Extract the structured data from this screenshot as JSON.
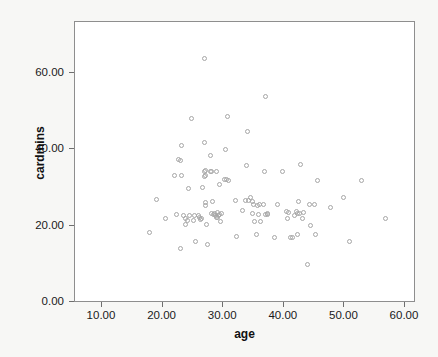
{
  "chart_data": {
    "type": "scatter",
    "title": "",
    "xlabel": "age",
    "ylabel": "cardmins",
    "xlim": [
      7.5,
      63.5
    ],
    "ylim": [
      0,
      73.5
    ],
    "grid": false,
    "legend": null,
    "xticks": [
      "10.00",
      "20.00",
      "30.00",
      "40.00",
      "50.00",
      "60.00"
    ],
    "xtick_values": [
      10,
      20,
      30,
      40,
      50,
      60
    ],
    "yticks": [
      "0.00",
      "20.00",
      "40.00",
      "60.00"
    ],
    "ytick_values": [
      0,
      20,
      40,
      60
    ],
    "marker": "open-circle",
    "marker_color": "#a6a6a6",
    "background_color": "#f7f7f5",
    "plot_background_color": "#ffffff",
    "frame_color": "#8e8e8e",
    "n_points": 108,
    "points": [
      [
        18.0,
        18.0
      ],
      [
        19.2,
        26.6
      ],
      [
        20.6,
        21.7
      ],
      [
        22.2,
        33.0
      ],
      [
        22.4,
        22.6
      ],
      [
        22.8,
        37.0
      ],
      [
        23.2,
        36.9
      ],
      [
        23.3,
        40.8
      ],
      [
        23.3,
        33.0
      ],
      [
        23.2,
        13.8
      ],
      [
        23.9,
        21.6
      ],
      [
        24.0,
        20.0
      ],
      [
        24.5,
        29.6
      ],
      [
        24.6,
        22.4
      ],
      [
        25.0,
        47.7
      ],
      [
        25.2,
        21.0
      ],
      [
        25.4,
        22.4
      ],
      [
        25.6,
        15.7
      ],
      [
        26.1,
        22.4
      ],
      [
        26.4,
        21.4
      ],
      [
        26.6,
        21.5
      ],
      [
        26.8,
        29.7
      ],
      [
        27.0,
        41.6
      ],
      [
        27.1,
        34.0
      ],
      [
        27.1,
        32.6
      ],
      [
        27.0,
        63.6
      ],
      [
        27.2,
        25.8
      ],
      [
        27.3,
        25.0
      ],
      [
        27.4,
        20.0
      ],
      [
        27.6,
        14.7
      ],
      [
        28.0,
        33.8
      ],
      [
        28.1,
        38.0
      ],
      [
        28.3,
        33.9
      ],
      [
        28.4,
        26.0
      ],
      [
        28.6,
        22.6
      ],
      [
        28.8,
        22.8
      ],
      [
        29.0,
        21.8
      ],
      [
        29.1,
        33.8
      ],
      [
        29.2,
        23.2
      ],
      [
        29.4,
        22.3
      ],
      [
        29.5,
        30.6
      ],
      [
        29.6,
        22.6
      ],
      [
        29.8,
        20.7
      ],
      [
        30.3,
        31.8
      ],
      [
        30.6,
        39.8
      ],
      [
        30.7,
        31.8
      ],
      [
        30.8,
        48.4
      ],
      [
        32.2,
        26.4
      ],
      [
        32.4,
        16.8
      ],
      [
        33.4,
        23.7
      ],
      [
        33.8,
        26.3
      ],
      [
        34.0,
        35.6
      ],
      [
        34.2,
        44.5
      ],
      [
        34.6,
        27.2
      ],
      [
        35.0,
        26.2
      ],
      [
        35.2,
        25.2
      ],
      [
        35.4,
        20.7
      ],
      [
        35.6,
        17.5
      ],
      [
        35.8,
        24.9
      ],
      [
        36.2,
        25.2
      ],
      [
        36.4,
        20.7
      ],
      [
        37.0,
        33.8
      ],
      [
        37.1,
        53.6
      ],
      [
        37.4,
        22.6
      ],
      [
        37.5,
        22.8
      ],
      [
        38.6,
        16.7
      ],
      [
        39.2,
        25.4
      ],
      [
        40.0,
        33.8
      ],
      [
        40.6,
        23.4
      ],
      [
        40.8,
        21.7
      ],
      [
        41.2,
        16.7
      ],
      [
        41.6,
        16.7
      ],
      [
        42.2,
        23.5
      ],
      [
        42.4,
        23.0
      ],
      [
        42.4,
        17.5
      ],
      [
        42.6,
        26.0
      ],
      [
        42.8,
        23.0
      ],
      [
        43.0,
        35.7
      ],
      [
        43.2,
        21.7
      ],
      [
        44.0,
        9.6
      ],
      [
        44.4,
        25.2
      ],
      [
        44.6,
        19.7
      ],
      [
        45.2,
        25.2
      ],
      [
        45.4,
        17.5
      ],
      [
        45.8,
        31.7
      ],
      [
        47.8,
        24.6
      ],
      [
        50.0,
        27.2
      ],
      [
        51.0,
        15.6
      ],
      [
        53.0,
        31.6
      ],
      [
        57.0,
        21.5
      ],
      [
        24.2,
        21.2
      ],
      [
        26.2,
        22.0
      ],
      [
        28.2,
        23.0
      ],
      [
        29.9,
        23.0
      ],
      [
        31.0,
        31.5
      ],
      [
        34.4,
        26.4
      ],
      [
        35.0,
        23.0
      ],
      [
        36.0,
        22.6
      ],
      [
        37.2,
        22.6
      ],
      [
        41.0,
        23.2
      ],
      [
        42.0,
        22.4
      ],
      [
        27.2,
        33.0
      ],
      [
        27.3,
        34.2
      ],
      [
        28.9,
        22.3
      ],
      [
        29.3,
        22.0
      ],
      [
        23.6,
        22.4
      ],
      [
        43.4,
        23.3
      ],
      [
        36.8,
        25.2
      ]
    ]
  }
}
